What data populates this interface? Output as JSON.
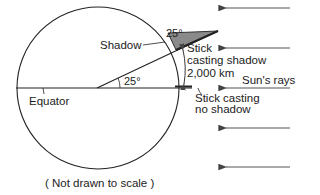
{
  "diagram": {
    "type": "eratosthenes-earth-measurement",
    "labels": {
      "shadow": "Shadow",
      "angle_at_stick": "25°",
      "angle_at_center": "25°",
      "stick_shadow_line1": "Stick",
      "stick_shadow_line2": "casting shadow",
      "distance": "2,000 km",
      "suns_rays": "Sun's rays",
      "stick_no_shadow_line1": "Stick casting",
      "stick_no_shadow_line2": "no shadow",
      "equator": "Equator",
      "note": "( Not drawn to scale )"
    },
    "colors": {
      "line": "#222222",
      "arrow": "#555555",
      "shadow_fill": "#8a8a8a"
    },
    "ray_count": 5
  }
}
